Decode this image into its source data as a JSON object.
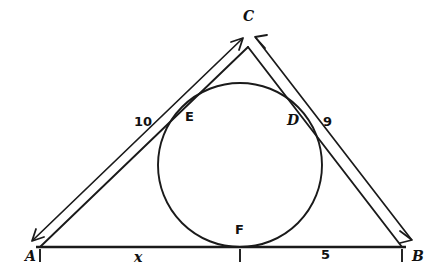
{
  "figure": {
    "type": "geometry-diagram",
    "background_color": "#ffffff",
    "stroke_color": "#1a1a1a"
  },
  "vertices": [
    {
      "id": "A",
      "label": "A",
      "x": 40,
      "y": 247,
      "label_x": 25,
      "label_y": 249
    },
    {
      "id": "B",
      "label": "B",
      "x": 402,
      "y": 247,
      "label_x": 412,
      "label_y": 249
    },
    {
      "id": "C",
      "label": "C",
      "x": 248,
      "y": 47,
      "label_x": 243,
      "label_y": 9
    }
  ],
  "tangent_points": [
    {
      "id": "D",
      "label": "D",
      "x": 305,
      "y": 130,
      "label_x": 287,
      "label_y": 113
    },
    {
      "id": "E",
      "label": "E",
      "x": 186,
      "y": 129,
      "label_x": 185,
      "label_y": 110
    },
    {
      "id": "F",
      "label": "F",
      "x": 240,
      "y": 247,
      "label_x": 235,
      "label_y": 223
    }
  ],
  "incircle": {
    "center_x": 240,
    "center_y": 165,
    "radius": 82
  },
  "measurements": [
    {
      "id": "side-ac",
      "label": "10",
      "label_x": 134,
      "label_y": 115,
      "from": "A",
      "to": "C"
    },
    {
      "id": "side-bc",
      "label": "9",
      "label_x": 323,
      "label_y": 115,
      "from": "C",
      "to": "B"
    },
    {
      "id": "segment-af",
      "label": "x",
      "label_x": 134,
      "label_y": 250,
      "from": "A",
      "to": "F"
    },
    {
      "id": "segment-fb",
      "label": "5",
      "label_x": 321,
      "label_y": 248,
      "from": "F",
      "to": "B"
    }
  ],
  "ticks": [
    {
      "id": "tick-a",
      "x": 40,
      "y": 247
    },
    {
      "id": "tick-f",
      "x": 240,
      "y": 247
    },
    {
      "id": "tick-b",
      "x": 402,
      "y": 247
    }
  ]
}
